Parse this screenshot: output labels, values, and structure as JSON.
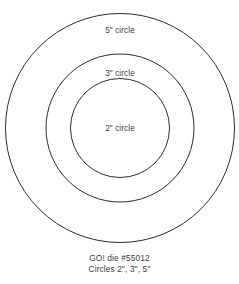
{
  "sheet": {
    "background_color": "#ffffff",
    "stroke_color": "#2b2b2b",
    "text_color": "#3b3b3b"
  },
  "diagram": {
    "type": "concentric-circles",
    "center": {
      "x": 120,
      "y": 128
    },
    "circles": [
      {
        "id": "outer",
        "label": "5\" circle",
        "diameter_inches": 5,
        "radius_px": 114.5,
        "stroke_color": "#2b2b2b"
      },
      {
        "id": "middle",
        "label": "3\" circle",
        "diameter_inches": 3,
        "radius_px": 74,
        "stroke_color": "#2b2b2b"
      },
      {
        "id": "inner",
        "label": "2\" circle",
        "diameter_inches": 2,
        "radius_px": 49.5,
        "stroke_color": "#2b2b2b"
      }
    ]
  },
  "caption": {
    "line1": "GO! die #55012",
    "line2": "Circles 2\", 3\", 5\""
  }
}
